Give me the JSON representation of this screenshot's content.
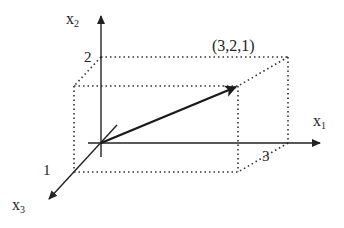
{
  "diagram": {
    "axes": {
      "x1": {
        "label": "x",
        "sub": "1",
        "tick": "3"
      },
      "x2": {
        "label": "x",
        "sub": "2",
        "tick": "2"
      },
      "x3": {
        "label": "x",
        "sub": "3",
        "tick": "1"
      }
    },
    "point_label": "(3,2,1)",
    "vector": {
      "from": [
        0,
        0,
        0
      ],
      "to": [
        3,
        2,
        1
      ]
    },
    "colors": {
      "axis": "#222222",
      "box": "#333333",
      "vector": "#1a1a1a",
      "background": "#ffffff"
    }
  }
}
